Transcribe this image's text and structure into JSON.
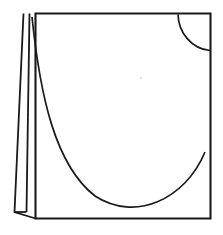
{
  "figure": {
    "title": "Open book line drawing",
    "style": {
      "background_color": "#ffffff",
      "line_color": "#1a1a1a",
      "fill": "none"
    },
    "canvas": {
      "width": 223,
      "height": 235
    },
    "elements": [
      {
        "name": "front-panel",
        "type": "quadrilateral",
        "label": "Main front panel",
        "path": "M 35.5 13.5 L 210.5 13.5 L 210.5 218.5 L 35.5 218.5 Z"
      },
      {
        "name": "spine-flap-outer",
        "type": "tapered-edge",
        "label": "Outer spine edge",
        "path": "M 23.5 13.5 L 14.5 212.0 L 35.5 218.5"
      },
      {
        "name": "spine-flap-inner",
        "type": "tapered-edge",
        "label": "Inner spine fold",
        "path": "M 29.5 13.5 L 26.5 212.0"
      },
      {
        "name": "spine-flap-bottom",
        "type": "edge",
        "label": "Spine flap bottom edge",
        "path": "M 14.5 212.0 L 26.5 212.0"
      },
      {
        "name": "page-curve",
        "type": "u-curve",
        "label": "Large page sweep curve",
        "path": "M 32.0 17.0 C 40.0 95.0 55.0 165.0 95.0 196.0 C 135.0 222.0 185.0 200.0 205.0 152.0"
      },
      {
        "name": "corner-arc",
        "type": "quarter-circle",
        "label": "Upper right corner arc",
        "path": "M 178.0 14.5 C 178.5 33.0 192.0 49.0 210.0 50.5"
      }
    ]
  }
}
